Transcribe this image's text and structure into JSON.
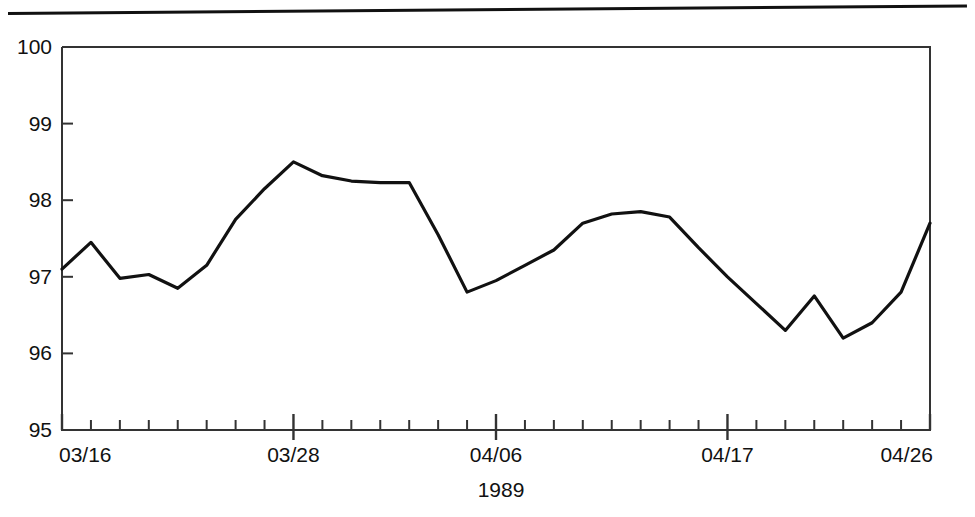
{
  "chart_data": {
    "type": "line",
    "title": "",
    "xlabel": "1989",
    "ylabel": "",
    "ylim": [
      95,
      100
    ],
    "yticks": [
      95,
      96,
      97,
      98,
      99,
      100
    ],
    "ytick_labels": [
      "95",
      "96",
      "97",
      "98",
      "99",
      "100"
    ],
    "grid": false,
    "legend": null,
    "x_tick_count": 31,
    "x_labeled_ticks": [
      {
        "index": 0,
        "label": "03/16"
      },
      {
        "index": 8,
        "label": "03/28"
      },
      {
        "index": 15,
        "label": "04/06"
      },
      {
        "index": 23,
        "label": "04/17"
      },
      {
        "index": 30,
        "label": "04/26"
      }
    ],
    "x": [
      "03/16",
      "03/17",
      "03/20",
      "03/21",
      "03/22",
      "03/23",
      "03/24",
      "03/27",
      "03/28",
      "03/29",
      "03/30",
      "03/31",
      "04/03",
      "04/04",
      "04/05",
      "04/06",
      "04/07",
      "04/10",
      "04/11",
      "04/12",
      "04/13",
      "04/14",
      "04/15",
      "04/17",
      "04/18",
      "04/19",
      "04/20",
      "04/21",
      "04/24",
      "04/25",
      "04/26"
    ],
    "series": [
      {
        "name": "index",
        "values": [
          97.1,
          97.45,
          96.98,
          97.03,
          96.85,
          97.15,
          97.75,
          98.15,
          98.5,
          98.32,
          98.25,
          98.23,
          98.23,
          97.55,
          96.8,
          96.95,
          97.15,
          97.35,
          97.7,
          97.82,
          97.85,
          97.78,
          97.38,
          97.0,
          96.65,
          96.3,
          96.75,
          96.2,
          96.4,
          96.8,
          97.7
        ]
      }
    ],
    "line_color": "#111111",
    "line_width": 3,
    "axis_color": "#333333",
    "background": "#ffffff"
  },
  "figure": {
    "top_rule": "horizontal-rule",
    "axis_label_year": "1989"
  }
}
